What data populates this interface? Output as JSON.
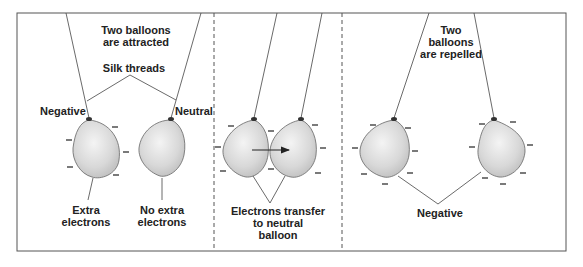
{
  "panels": [
    {
      "id": "attracted",
      "title_line1": "Two balloons",
      "title_line2": "are attracted",
      "threads_label": "Silk threads",
      "left_label": "Negative",
      "right_label": "Neutral",
      "left_note_line1": "Extra",
      "left_note_line2": "electrons",
      "right_note_line1": "No extra",
      "right_note_line2": "electrons"
    },
    {
      "id": "transfer",
      "caption_line1": "Electrons transfer",
      "caption_line2": "to neutral",
      "caption_line3": "balloon"
    },
    {
      "id": "repelled",
      "title_line1": "Two",
      "title_line2": "balloons",
      "title_line3": "are repelled",
      "bottom_label": "Negative"
    }
  ],
  "colors": {
    "frame": "#555555",
    "balloon_fill": "#dcdcdc",
    "balloon_stroke": "#666666",
    "text": "#222222"
  }
}
